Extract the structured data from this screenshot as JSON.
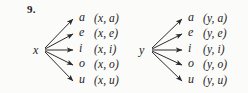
{
  "figure": {
    "exercise_number": "9.",
    "background_color": "#fbfbfa",
    "ink_color": "#232323"
  },
  "diagrams": [
    {
      "id": "tree-x",
      "root_label": "x",
      "branches": [
        {
          "target": "a",
          "pair": "(x, a)"
        },
        {
          "target": "e",
          "pair": "(x, e)"
        },
        {
          "target": "i",
          "pair": "(x, i)"
        },
        {
          "target": "o",
          "pair": "(x, o)"
        },
        {
          "target": "u",
          "pair": "(x, u)"
        }
      ]
    },
    {
      "id": "tree-y",
      "root_label": "y",
      "branches": [
        {
          "target": "a",
          "pair": "(y, a)"
        },
        {
          "target": "e",
          "pair": "(y, e)"
        },
        {
          "target": "i",
          "pair": "(y, i)"
        },
        {
          "target": "o",
          "pair": "(y, o)"
        },
        {
          "target": "u",
          "pair": "(y, u)"
        }
      ]
    }
  ]
}
